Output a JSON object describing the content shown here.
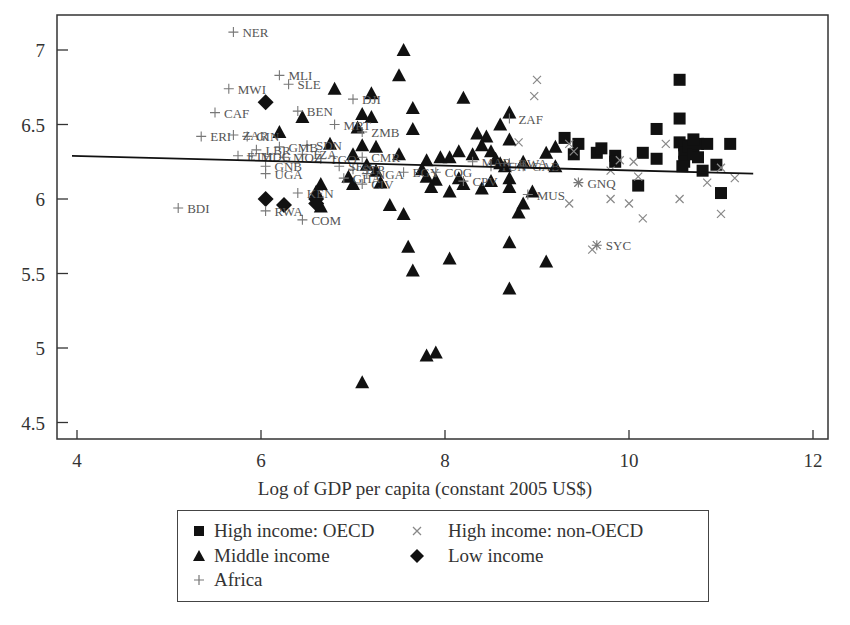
{
  "chart_data": {
    "type": "scatter",
    "title": "",
    "xlabel": "Log of GDP per capita (constant 2005 US$)",
    "ylabel": "",
    "xlim": [
      3.8,
      12.15
    ],
    "ylim": [
      4.4,
      7.25
    ],
    "xticks": [
      4,
      6,
      8,
      10,
      12
    ],
    "yticks": [
      4.5,
      5,
      5.5,
      6,
      6.5,
      7
    ],
    "ytick_labels": [
      "4.5",
      "5",
      "5.5",
      "6",
      "6.5",
      "7"
    ],
    "grid": false,
    "legend_position": "below",
    "regression_line": {
      "x": [
        4.0,
        11.35
      ],
      "y": [
        6.29,
        6.17
      ]
    },
    "series": [
      {
        "name": "High income: OECD",
        "marker": "square",
        "color": "#111111",
        "points": [
          [
            9.3,
            6.41
          ],
          [
            9.45,
            6.37
          ],
          [
            9.4,
            6.3
          ],
          [
            9.65,
            6.31
          ],
          [
            9.7,
            6.34
          ],
          [
            9.85,
            6.29
          ],
          [
            9.85,
            6.25
          ],
          [
            10.1,
            6.09
          ],
          [
            10.15,
            6.31
          ],
          [
            10.3,
            6.47
          ],
          [
            10.3,
            6.27
          ],
          [
            10.55,
            6.8
          ],
          [
            10.55,
            6.54
          ],
          [
            10.55,
            6.38
          ],
          [
            10.6,
            6.36
          ],
          [
            10.6,
            6.31
          ],
          [
            10.6,
            6.25
          ],
          [
            10.65,
            6.35
          ],
          [
            10.7,
            6.3
          ],
          [
            10.75,
            6.37
          ],
          [
            10.75,
            6.28
          ],
          [
            10.8,
            6.19
          ],
          [
            10.85,
            6.37
          ],
          [
            10.95,
            6.23
          ],
          [
            11.0,
            6.04
          ],
          [
            11.1,
            6.37
          ],
          [
            10.58,
            6.22
          ],
          [
            10.7,
            6.4
          ]
        ]
      },
      {
        "name": "High income: non-OECD",
        "marker": "x",
        "color": "#888888",
        "points": [
          [
            9.0,
            6.8
          ],
          [
            8.97,
            6.69
          ],
          [
            8.8,
            6.38
          ],
          [
            9.35,
            6.37
          ],
          [
            9.4,
            6.32
          ],
          [
            9.45,
            6.11
          ],
          [
            9.35,
            5.97
          ],
          [
            9.6,
            5.66
          ],
          [
            9.8,
            6.19
          ],
          [
            9.8,
            6.0
          ],
          [
            10.0,
            5.97
          ],
          [
            10.1,
            6.15
          ],
          [
            10.15,
            5.87
          ],
          [
            10.4,
            6.37
          ],
          [
            10.55,
            6.0
          ],
          [
            10.85,
            6.11
          ],
          [
            11.0,
            6.21
          ],
          [
            11.0,
            5.9
          ],
          [
            11.15,
            6.14
          ],
          [
            9.9,
            6.26
          ],
          [
            10.05,
            6.25
          ]
        ]
      },
      {
        "name": "Middle income",
        "marker": "triangle",
        "color": "#111111",
        "points": [
          [
            7.55,
            7.0
          ],
          [
            7.5,
            6.83
          ],
          [
            6.8,
            6.74
          ],
          [
            7.2,
            6.71
          ],
          [
            7.65,
            6.61
          ],
          [
            7.1,
            6.57
          ],
          [
            6.45,
            6.55
          ],
          [
            7.2,
            6.55
          ],
          [
            7.65,
            6.47
          ],
          [
            8.2,
            6.68
          ],
          [
            8.7,
            6.58
          ],
          [
            8.6,
            6.5
          ],
          [
            6.2,
            6.45
          ],
          [
            7.05,
            6.48
          ],
          [
            8.35,
            6.44
          ],
          [
            8.45,
            6.42
          ],
          [
            7.1,
            6.36
          ],
          [
            6.75,
            6.37
          ],
          [
            7.25,
            6.35
          ],
          [
            8.15,
            6.32
          ],
          [
            8.4,
            6.36
          ],
          [
            8.7,
            6.4
          ],
          [
            8.5,
            6.32
          ],
          [
            9.2,
            6.35
          ],
          [
            9.1,
            6.31
          ],
          [
            7.0,
            6.3
          ],
          [
            7.5,
            6.3
          ],
          [
            7.8,
            6.26
          ],
          [
            7.95,
            6.28
          ],
          [
            8.05,
            6.28
          ],
          [
            8.3,
            6.3
          ],
          [
            8.55,
            6.27
          ],
          [
            8.6,
            6.24
          ],
          [
            8.65,
            6.22
          ],
          [
            8.85,
            6.25
          ],
          [
            9.2,
            6.22
          ],
          [
            7.15,
            6.23
          ],
          [
            7.25,
            6.19
          ],
          [
            6.95,
            6.15
          ],
          [
            7.75,
            6.2
          ],
          [
            7.8,
            6.15
          ],
          [
            7.9,
            6.13
          ],
          [
            8.15,
            6.14
          ],
          [
            8.2,
            6.1
          ],
          [
            8.5,
            6.12
          ],
          [
            8.7,
            6.14
          ],
          [
            6.65,
            6.1
          ],
          [
            7.0,
            6.1
          ],
          [
            7.3,
            6.11
          ],
          [
            7.85,
            6.08
          ],
          [
            8.05,
            6.05
          ],
          [
            8.4,
            6.07
          ],
          [
            8.7,
            6.08
          ],
          [
            8.95,
            6.05
          ],
          [
            6.6,
            6.05
          ],
          [
            7.4,
            5.96
          ],
          [
            8.85,
            5.97
          ],
          [
            8.8,
            5.91
          ],
          [
            7.55,
            5.9
          ],
          [
            6.65,
            5.95
          ],
          [
            8.7,
            5.71
          ],
          [
            7.6,
            5.68
          ],
          [
            7.65,
            5.52
          ],
          [
            8.05,
            5.6
          ],
          [
            9.1,
            5.58
          ],
          [
            8.7,
            5.4
          ],
          [
            7.8,
            4.95
          ],
          [
            7.9,
            4.97
          ],
          [
            7.1,
            4.77
          ]
        ]
      },
      {
        "name": "Low income",
        "marker": "diamond",
        "color": "#111111",
        "points": [
          [
            6.05,
            6.65
          ],
          [
            6.05,
            6.0
          ],
          [
            6.25,
            5.96
          ],
          [
            6.6,
            6.0
          ],
          [
            6.6,
            5.97
          ]
        ]
      },
      {
        "name": "Africa",
        "marker": "plus",
        "color": "#777777",
        "points": [
          {
            "x": 5.7,
            "y": 7.12,
            "label": "NER"
          },
          {
            "x": 6.2,
            "y": 6.83,
            "label": "MLI"
          },
          {
            "x": 6.3,
            "y": 6.77,
            "label": "SLE"
          },
          {
            "x": 5.65,
            "y": 6.74,
            "label": "MWI"
          },
          {
            "x": 5.5,
            "y": 6.58,
            "label": "CAF"
          },
          {
            "x": 6.4,
            "y": 6.59,
            "label": "BEN"
          },
          {
            "x": 7.0,
            "y": 6.67,
            "label": "DJI"
          },
          {
            "x": 6.8,
            "y": 6.5,
            "label": "MRT"
          },
          {
            "x": 7.1,
            "y": 6.45,
            "label": "ZMB"
          },
          {
            "x": 8.7,
            "y": 6.54,
            "label": "ZAF"
          },
          {
            "x": 5.35,
            "y": 6.42,
            "label": "ERI"
          },
          {
            "x": 5.7,
            "y": 6.43,
            "label": "ZAR"
          },
          {
            "x": 5.85,
            "y": 6.42,
            "label": "GIN"
          },
          {
            "x": 6.2,
            "y": 6.35,
            "label": "GMB"
          },
          {
            "x": 5.95,
            "y": 6.33,
            "label": "LBR"
          },
          {
            "x": 5.9,
            "y": 6.29,
            "label": "MDG"
          },
          {
            "x": 6.25,
            "y": 6.28,
            "label": "MOZ"
          },
          {
            "x": 6.45,
            "y": 6.3,
            "label": "TZA"
          },
          {
            "x": 7.1,
            "y": 6.28,
            "label": "CMR"
          },
          {
            "x": 6.65,
            "y": 6.27,
            "label": "TGO"
          },
          {
            "x": 6.05,
            "y": 6.22,
            "label": "GNB"
          },
          {
            "x": 6.05,
            "y": 6.17,
            "label": "UGA"
          },
          {
            "x": 6.85,
            "y": 6.22,
            "label": "SEN"
          },
          {
            "x": 7.0,
            "y": 6.2,
            "label": "STP"
          },
          {
            "x": 7.15,
            "y": 6.17,
            "label": "NGA"
          },
          {
            "x": 6.9,
            "y": 6.14,
            "label": "GHA"
          },
          {
            "x": 7.1,
            "y": 6.1,
            "label": "CIV"
          },
          {
            "x": 7.55,
            "y": 6.18,
            "label": "EGY"
          },
          {
            "x": 7.9,
            "y": 6.18,
            "label": "COG"
          },
          {
            "x": 8.2,
            "y": 6.12,
            "label": "CPV"
          },
          {
            "x": 8.5,
            "y": 6.22,
            "label": "TUN"
          },
          {
            "x": 8.3,
            "y": 6.25,
            "label": "MAR"
          },
          {
            "x": 8.7,
            "y": 6.24,
            "label": "BWA"
          },
          {
            "x": 8.85,
            "y": 6.22,
            "label": "GAB"
          },
          {
            "x": 8.9,
            "y": 6.03,
            "label": "MUS"
          },
          {
            "x": 6.4,
            "y": 6.04,
            "label": "KEN"
          },
          {
            "x": 6.05,
            "y": 5.92,
            "label": "RWA"
          },
          {
            "x": 6.45,
            "y": 5.86,
            "label": "COM"
          },
          {
            "x": 5.1,
            "y": 5.94,
            "label": "BDI"
          },
          {
            "x": 5.75,
            "y": 6.29,
            "label": "ETH"
          },
          {
            "x": 6.5,
            "y": 6.36,
            "label": "SDN"
          }
        ]
      },
      {
        "name": "Africa (high income)",
        "marker": "asterisk",
        "color": "#777777",
        "points": [
          {
            "x": 9.45,
            "y": 6.11,
            "label": "GNQ"
          },
          {
            "x": 9.65,
            "y": 5.69,
            "label": "SYC"
          }
        ]
      }
    ],
    "legend": [
      {
        "marker": "square",
        "label": "High income: OECD"
      },
      {
        "marker": "x",
        "label": "High income: non-OECD"
      },
      {
        "marker": "triangle",
        "label": "Middle income"
      },
      {
        "marker": "diamond",
        "label": "Low income"
      },
      {
        "marker": "plus",
        "label": "Africa"
      }
    ]
  }
}
